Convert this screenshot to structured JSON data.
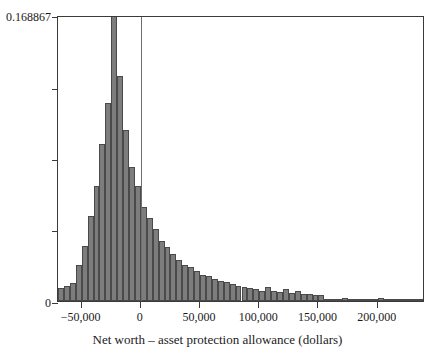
{
  "chart_data": {
    "type": "bar",
    "title": "",
    "subtitle": "",
    "xlabel": "Net worth – asset protection allowance (dollars)",
    "ylabel": "",
    "grid": false,
    "legend": null,
    "xlim": [
      -70000,
      240000
    ],
    "ylim": [
      0,
      0.168867
    ],
    "bin_width": 5000,
    "xticks": [
      -50000,
      0,
      50000,
      100000,
      150000,
      200000
    ],
    "xtick_labels": [
      "−50,000",
      "0",
      "50,000",
      "100,000",
      "150,000",
      "200,000"
    ],
    "yticks": [
      0,
      0.042217,
      0.084434,
      0.12665,
      0.168867
    ],
    "ytick_labels": [
      "0",
      "",
      "",
      "",
      "0.168867"
    ],
    "reference_lines": [
      {
        "axis": "x",
        "value": 0,
        "color": "#6e6e6e"
      }
    ],
    "bar_color": "#7d7d7d",
    "bar_edge_color": "#4a4a4a",
    "bin_starts": [
      -70000,
      -65000,
      -60000,
      -55000,
      -50000,
      -45000,
      -40000,
      -35000,
      -30000,
      -25000,
      -20000,
      -15000,
      -10000,
      -5000,
      0,
      5000,
      10000,
      15000,
      20000,
      25000,
      30000,
      35000,
      40000,
      45000,
      50000,
      55000,
      60000,
      65000,
      70000,
      75000,
      80000,
      85000,
      90000,
      95000,
      100000,
      105000,
      110000,
      115000,
      120000,
      125000,
      130000,
      135000,
      140000,
      145000,
      150000,
      155000,
      160000,
      165000,
      170000,
      175000,
      180000,
      185000,
      190000,
      195000,
      200000,
      205000,
      210000,
      215000,
      220000,
      225000,
      230000,
      235000
    ],
    "values": [
      0.0079,
      0.0091,
      0.0106,
      0.0215,
      0.0323,
      0.05,
      0.068,
      0.093,
      0.117,
      0.1689,
      0.133,
      0.101,
      0.079,
      0.068,
      0.0555,
      0.049,
      0.0425,
      0.0355,
      0.032,
      0.028,
      0.0245,
      0.0215,
      0.02,
      0.0175,
      0.0155,
      0.0145,
      0.013,
      0.012,
      0.011,
      0.0098,
      0.009,
      0.0082,
      0.0076,
      0.007,
      0.0062,
      0.008,
      0.0058,
      0.0054,
      0.007,
      0.005,
      0.006,
      0.0044,
      0.004,
      0.0036,
      0.0034,
      0.0012,
      0.001,
      0.0009,
      0.002,
      0.0008,
      0.0007,
      0.0006,
      0.0006,
      0.0005,
      0.0019,
      0.0005,
      0.0004,
      0.0004,
      0.0004,
      0.0003,
      0.0012,
      0.001
    ]
  }
}
